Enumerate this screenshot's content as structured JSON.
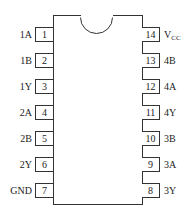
{
  "diagram": {
    "type": "ic-pinout",
    "package": "14-pin DIP",
    "left_pins": [
      {
        "number": "1",
        "label": "1A"
      },
      {
        "number": "2",
        "label": "1B"
      },
      {
        "number": "3",
        "label": "1Y"
      },
      {
        "number": "4",
        "label": "2A"
      },
      {
        "number": "5",
        "label": "2B"
      },
      {
        "number": "6",
        "label": "2Y"
      },
      {
        "number": "7",
        "label": "GND"
      }
    ],
    "right_pins": [
      {
        "number": "14",
        "label": "V",
        "label_sub": "CC"
      },
      {
        "number": "13",
        "label": "4B"
      },
      {
        "number": "12",
        "label": "4A"
      },
      {
        "number": "11",
        "label": "4Y"
      },
      {
        "number": "10",
        "label": "3B"
      },
      {
        "number": "9",
        "label": "3A"
      },
      {
        "number": "8",
        "label": "3Y"
      }
    ]
  }
}
